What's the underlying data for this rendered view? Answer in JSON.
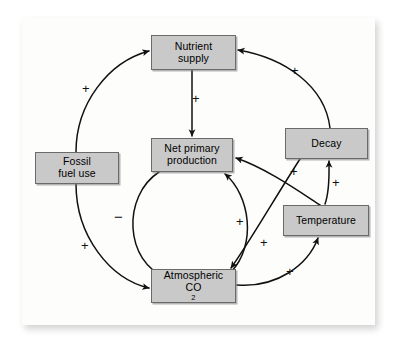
{
  "figure": {
    "type": "causal-loop-diagram",
    "background_color": "#ffffff",
    "card_color": "#fdfdfc",
    "node_fill_color": "#c9c9c9",
    "node_border_color": "#6a6a6a",
    "arrow_color": "#111111"
  },
  "nodes": [
    {
      "id": "nutrient-supply",
      "label": "Nutrient supply",
      "line1": "Nutrient",
      "line2": "supply",
      "x": 151,
      "y": 35,
      "w": 85,
      "h": 35
    },
    {
      "id": "net-primary-production",
      "label": "Net primary production",
      "line1": "Net primary",
      "line2": "production",
      "x": 151,
      "y": 138,
      "w": 82,
      "h": 34
    },
    {
      "id": "atmospheric-co2",
      "label": "Atmospheric CO2",
      "line1": "Atmospheric",
      "line2": "CO",
      "sub": "2",
      "x": 151,
      "y": 269,
      "w": 85,
      "h": 34
    },
    {
      "id": "fossil-fuel-use",
      "label": "Fossil fuel use",
      "line1": "Fossil",
      "line2": "fuel use",
      "x": 35,
      "y": 152,
      "w": 84,
      "h": 32
    },
    {
      "id": "decay",
      "label": "Decay",
      "line1": "Decay",
      "line2": "",
      "x": 285,
      "y": 128,
      "w": 83,
      "h": 31
    },
    {
      "id": "temperature",
      "label": "Temperature",
      "line1": "Temperature",
      "line2": "",
      "x": 283,
      "y": 205,
      "w": 86,
      "h": 31
    }
  ],
  "edges": [
    {
      "id": "fossil-to-nutrient",
      "from": "fossil-fuel-use",
      "to": "nutrient-supply",
      "sign": "+",
      "sign_x": 82,
      "sign_y": 82
    },
    {
      "id": "fossil-to-co2",
      "from": "fossil-fuel-use",
      "to": "atmospheric-co2",
      "sign": "+",
      "sign_x": 81,
      "sign_y": 239
    },
    {
      "id": "nutrient-to-npp",
      "from": "nutrient-supply",
      "to": "net-primary-production",
      "sign": "+",
      "sign_x": 192,
      "sign_y": 92
    },
    {
      "id": "npp-to-co2",
      "from": "net-primary-production",
      "to": "atmospheric-co2",
      "sign": "−",
      "sign_x": 114,
      "sign_y": 209
    },
    {
      "id": "co2-to-npp",
      "from": "atmospheric-co2",
      "to": "net-primary-production",
      "sign": "+",
      "sign_x": 236,
      "sign_y": 215
    },
    {
      "id": "decay-to-nutrient",
      "from": "decay",
      "to": "nutrient-supply",
      "sign": "+",
      "sign_x": 291,
      "sign_y": 64
    },
    {
      "id": "decay-to-co2",
      "from": "decay",
      "to": "atmospheric-co2",
      "sign": "+",
      "sign_x": 260,
      "sign_y": 236
    },
    {
      "id": "temperature-to-npp",
      "from": "temperature",
      "to": "net-primary-production",
      "sign": "+",
      "sign_x": 290,
      "sign_y": 165
    },
    {
      "id": "temperature-to-decay",
      "from": "temperature",
      "to": "decay",
      "sign": "+",
      "sign_x": 332,
      "sign_y": 176
    },
    {
      "id": "co2-to-temperature",
      "from": "atmospheric-co2",
      "to": "temperature",
      "sign": "+",
      "sign_x": 286,
      "sign_y": 265
    }
  ],
  "signs": {
    "plus": "+",
    "minus": "−"
  }
}
